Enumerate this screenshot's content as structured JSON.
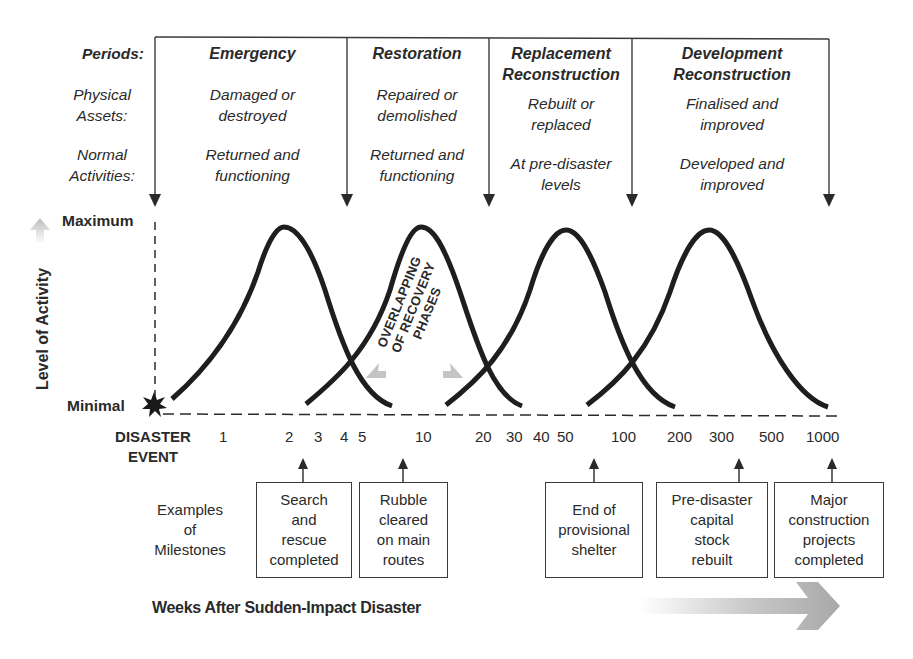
{
  "row_labels": {
    "periods": "Periods:",
    "physical_assets_1": "Physical",
    "physical_assets_2": "Assets:",
    "normal_activities_1": "Normal",
    "normal_activities_2": "Activities:"
  },
  "periods": [
    {
      "title_1": "Emergency",
      "title_2": "",
      "assets_1": "Damaged or",
      "assets_2": "destroyed",
      "activities_1": "Returned and",
      "activities_2": "functioning"
    },
    {
      "title_1": "Restoration",
      "title_2": "",
      "assets_1": "Repaired or",
      "assets_2": "demolished",
      "activities_1": "Returned and",
      "activities_2": "functioning"
    },
    {
      "title_1": "Replacement",
      "title_2": "Reconstruction",
      "assets_1": "Rebuilt or",
      "assets_2": "replaced",
      "activities_1": "At pre-disaster",
      "activities_2": "levels"
    },
    {
      "title_1": "Development",
      "title_2": "Reconstruction",
      "assets_1": "Finalised and",
      "assets_2": "improved",
      "activities_1": "Developed and",
      "activities_2": "improved"
    }
  ],
  "y_axis": {
    "title": "Level of Activity",
    "max_label": "Maximum",
    "min_label": "Minimal"
  },
  "annotation": {
    "line_1": "OVERLAPPING",
    "line_2": "OF RECOVERY",
    "line_3": "PHASES"
  },
  "x_axis": {
    "origin_label_1": "DISASTER",
    "origin_label_2": "EVENT",
    "ticks": [
      "1",
      "2",
      "3",
      "4",
      "5",
      "10",
      "20",
      "30",
      "40",
      "50",
      "100",
      "200",
      "300",
      "500",
      "1000"
    ],
    "title": "Weeks After Sudden-Impact Disaster"
  },
  "milestones": {
    "label_1": "Examples",
    "label_2": "of",
    "label_3": "Milestones",
    "items": [
      {
        "line_1": "Search",
        "line_2": "and",
        "line_3": "rescue",
        "line_4": "completed",
        "week": "2"
      },
      {
        "line_1": "Rubble",
        "line_2": "cleared",
        "line_3": "on main",
        "line_4": "routes",
        "week": "10"
      },
      {
        "line_1": "End of",
        "line_2": "provisional",
        "line_3": "shelter",
        "line_4": "",
        "week": "~70"
      },
      {
        "line_1": "Pre-disaster",
        "line_2": "capital",
        "line_3": "stock",
        "line_4": "rebuilt",
        "week": "~350"
      },
      {
        "line_1": "Major",
        "line_2": "construction",
        "line_3": "projects",
        "line_4": "completed",
        "week": "1000"
      }
    ]
  },
  "colors": {
    "ink": "#2a2a2a",
    "curve": "#1e1e1e",
    "arrow_gray": "#b5b5b5"
  }
}
